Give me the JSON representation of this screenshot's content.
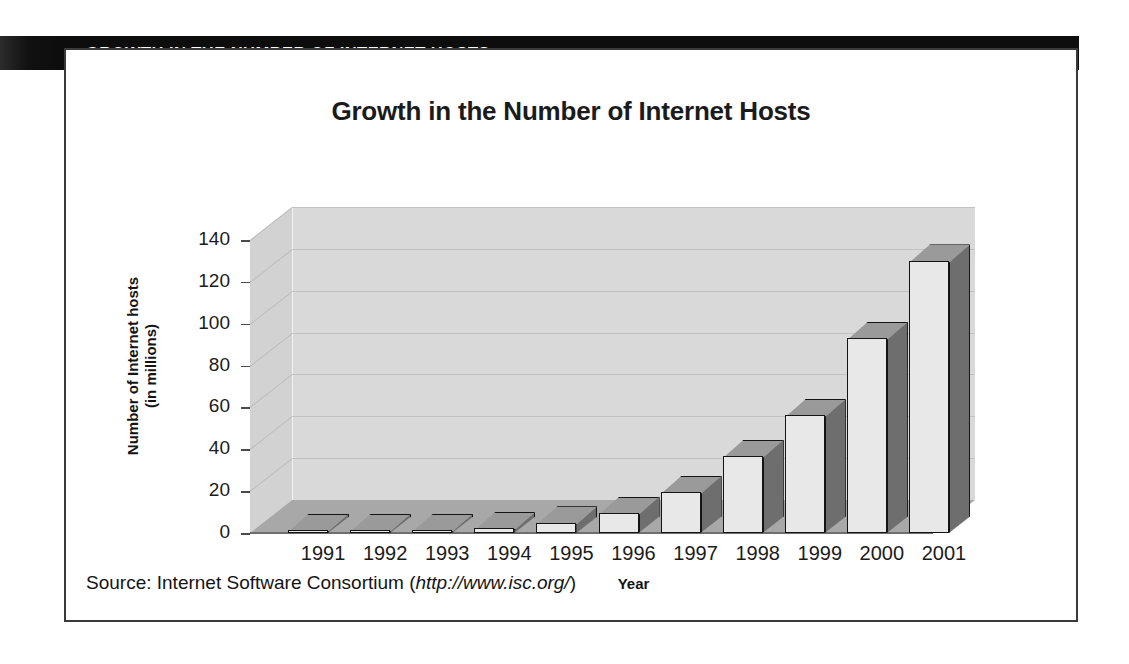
{
  "header": {
    "band_title": "GROWTH IN THE NUMBER OF INTERNET HOSTS"
  },
  "figure": {
    "title": "Growth in the Number of Internet Hosts",
    "source_prefix": "Source: Internet Software Consortium (",
    "source_url": "http://www.isc.org/",
    "source_suffix": ")"
  },
  "colors": {
    "header_band": "#0d0d0d",
    "header_text": "#ffffff",
    "frame_border": "#3a3a3a",
    "wall_back": "#d9d9d9",
    "wall_side": "#d2d2d2",
    "floor": "#a8a8a8",
    "bar_front": "#e8e8e8",
    "bar_side": "#6e6e6e",
    "bar_top": "#9a9a9a",
    "bar_outline": "#141414",
    "gridline": "#c2c2c2",
    "text": "#1b1b1b"
  },
  "chart_data": {
    "type": "bar",
    "title": "Growth in the Number of Internet Hosts",
    "xlabel": "Year",
    "ylabel": "Number of Internet hosts\n(in millions)",
    "ylabel_line1": "Number of Internet hosts",
    "ylabel_line2": "(in millions)",
    "categories": [
      "1991",
      "1992",
      "1993",
      "1994",
      "1995",
      "1996",
      "1997",
      "1998",
      "1999",
      "2000",
      "2001"
    ],
    "values": [
      0.4,
      0.8,
      1.3,
      2.2,
      4.9,
      9.5,
      19.5,
      36.7,
      56.2,
      93.0,
      130.0
    ],
    "ylim": [
      0,
      140
    ],
    "yticks": [
      0,
      20,
      40,
      60,
      80,
      100,
      120,
      140
    ],
    "ytick_labels": [
      "0",
      "20",
      "40",
      "60",
      "80",
      "100",
      "120",
      "140"
    ],
    "grid": true,
    "legend": "none",
    "style": "3d-column",
    "units": "millions of hosts",
    "source": "Internet Software Consortium (http://www.isc.org/)"
  }
}
